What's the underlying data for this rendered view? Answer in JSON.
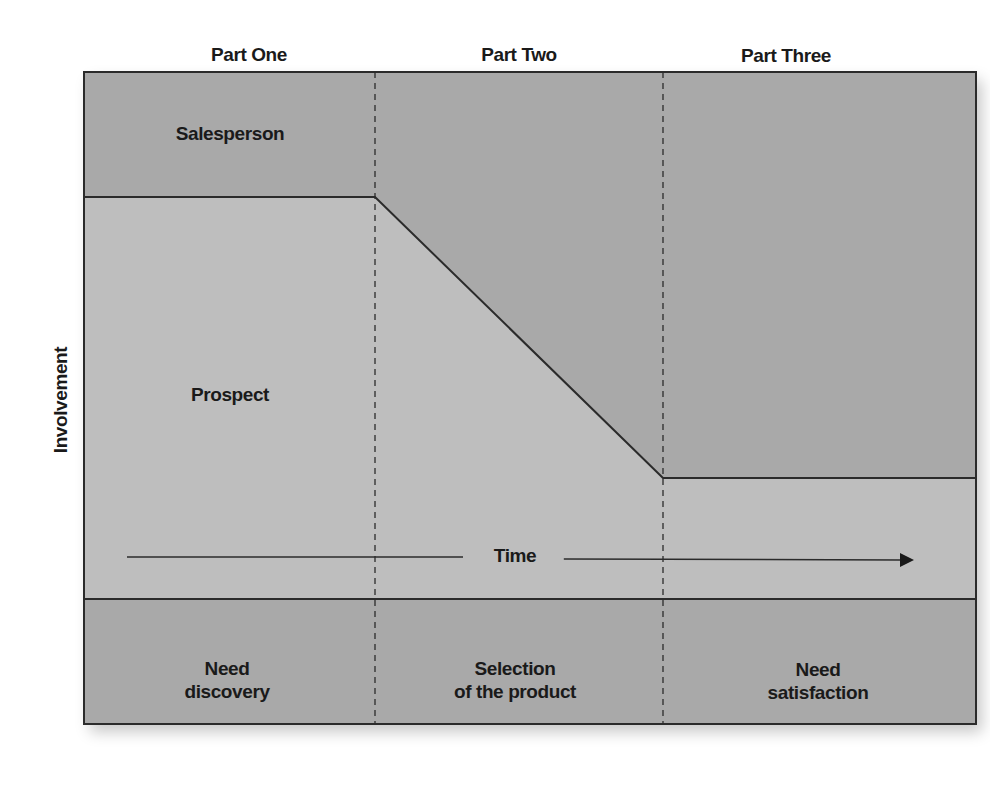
{
  "diagram": {
    "parts": [
      {
        "label": "Part One"
      },
      {
        "label": "Part Two"
      },
      {
        "label": "Part Three"
      }
    ],
    "regions": {
      "salesperson_label": "Salesperson",
      "prospect_label": "Prospect"
    },
    "axes": {
      "y_label": "Involvement",
      "x_label": "Time"
    },
    "phases": [
      {
        "label": "Need\ndiscovery"
      },
      {
        "label": "Selection\nof the product"
      },
      {
        "label": "Need\nsatisfaction"
      }
    ],
    "colors": {
      "salesperson_fill": "#a9a9a9",
      "prospect_fill": "#bebebe",
      "phase_fill": "#a9a9a9",
      "line": "#2b2b2b",
      "text": "#1a1a1a"
    },
    "boundary_line": {
      "description": "Salesperson/Prospect involvement boundary",
      "points": [
        {
          "x_pct": 0,
          "y_px": 197
        },
        {
          "x_pct": 33.3,
          "y_px": 197
        },
        {
          "x_pct": 66.7,
          "y_px": 478
        },
        {
          "x_pct": 100,
          "y_px": 478
        }
      ]
    }
  }
}
